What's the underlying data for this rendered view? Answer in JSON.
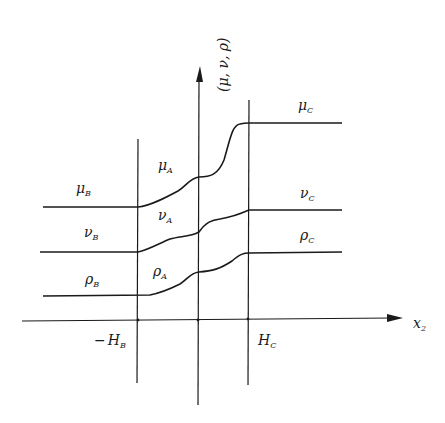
{
  "diagram": {
    "type": "piecewise profile diagram",
    "colors": {
      "line": "#1a1a1a",
      "background": "#ffffff"
    },
    "axes": {
      "x_label": {
        "base": "x",
        "sub": "2"
      },
      "y_label": "(μ, ν, ρ)"
    },
    "markers": {
      "left": {
        "sign": "−",
        "base": "H",
        "sub": "B"
      },
      "right": {
        "base": "H",
        "sub": "C"
      }
    },
    "curves": [
      {
        "name": "mu",
        "labels": {
          "B": {
            "base": "μ",
            "sub": "B"
          },
          "A": {
            "base": "μ",
            "sub": "A"
          },
          "C": {
            "base": "μ",
            "sub": "C"
          }
        }
      },
      {
        "name": "nu",
        "labels": {
          "B": {
            "base": "ν",
            "sub": "B"
          },
          "A": {
            "base": "ν",
            "sub": "A"
          },
          "C": {
            "base": "ν",
            "sub": "C"
          }
        }
      },
      {
        "name": "rho",
        "labels": {
          "B": {
            "base": "ρ",
            "sub": "B"
          },
          "A": {
            "base": "ρ",
            "sub": "A"
          },
          "C": {
            "base": "ρ",
            "sub": "C"
          }
        }
      }
    ]
  }
}
